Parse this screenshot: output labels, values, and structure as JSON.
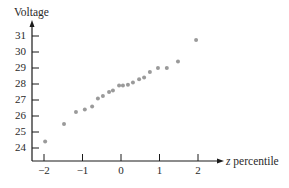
{
  "chart_data": {
    "type": "scatter",
    "title": "",
    "xlabel_var": "z",
    "xlabel_rest": " percentile",
    "xlabel": "z percentile",
    "ylabel": "Voltage",
    "xlim": [
      -2.3,
      2.7
    ],
    "ylim": [
      23.2,
      32
    ],
    "x_ticks": [
      -2,
      -1,
      0,
      1,
      2
    ],
    "x_tick_labels": [
      "−2",
      "−1",
      "0",
      "1",
      "2"
    ],
    "y_ticks": [
      24,
      25,
      26,
      27,
      28,
      29,
      30,
      31
    ],
    "y_tick_labels": [
      "24",
      "25",
      "26",
      "27",
      "28",
      "29",
      "30",
      "31"
    ],
    "grid": false,
    "legend": null,
    "marker_color": "#9a9a9a",
    "axis_color": "#1a1a1a",
    "points": [
      {
        "x": -1.97,
        "y": 24.4
      },
      {
        "x": -1.48,
        "y": 25.5
      },
      {
        "x": -1.17,
        "y": 26.25
      },
      {
        "x": -0.94,
        "y": 26.4
      },
      {
        "x": -0.75,
        "y": 26.6
      },
      {
        "x": -0.6,
        "y": 27.1
      },
      {
        "x": -0.47,
        "y": 27.25
      },
      {
        "x": -0.31,
        "y": 27.5
      },
      {
        "x": -0.21,
        "y": 27.6
      },
      {
        "x": -0.05,
        "y": 27.9
      },
      {
        "x": 0.05,
        "y": 27.9
      },
      {
        "x": 0.18,
        "y": 27.95
      },
      {
        "x": 0.31,
        "y": 28.1
      },
      {
        "x": 0.47,
        "y": 28.3
      },
      {
        "x": 0.6,
        "y": 28.4
      },
      {
        "x": 0.75,
        "y": 28.75
      },
      {
        "x": 0.96,
        "y": 29.0
      },
      {
        "x": 1.19,
        "y": 29.0
      },
      {
        "x": 1.48,
        "y": 29.4
      },
      {
        "x": 1.95,
        "y": 30.75
      }
    ]
  }
}
